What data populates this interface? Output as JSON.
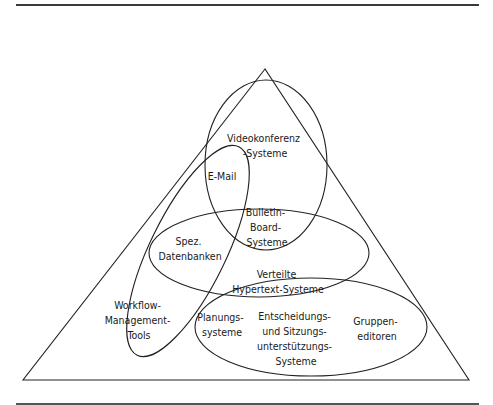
{
  "diagram": {
    "type": "venn-in-triangle",
    "frame": {
      "top_rule": true,
      "bottom_rule": true
    },
    "colors": {
      "stroke": "#222222",
      "text": "#1a1a1a",
      "background": "#ffffff"
    },
    "triangle": {
      "apex": [
        265,
        69
      ],
      "bottom_left": [
        23,
        380
      ],
      "bottom_right": [
        469,
        380
      ]
    },
    "regions": [
      {
        "id": "videokonferenz",
        "lines": [
          "Videokonferenz",
          "-Systeme"
        ]
      },
      {
        "id": "email",
        "lines": [
          "E-Mail"
        ]
      },
      {
        "id": "bulletin",
        "lines": [
          "Bulletin-",
          "Board-",
          "Systeme"
        ]
      },
      {
        "id": "datenbanken",
        "lines": [
          "Spez.",
          "Datenbanken"
        ]
      },
      {
        "id": "hypertext",
        "lines": [
          "Verteilte",
          "Hypertext-Systeme"
        ]
      },
      {
        "id": "workflow",
        "lines": [
          "Workflow-",
          "Management-",
          "Tools"
        ]
      },
      {
        "id": "planung",
        "lines": [
          "Planungs-",
          "systeme"
        ]
      },
      {
        "id": "entscheidung",
        "lines": [
          "Entscheidungs-",
          "und Sitzungs-",
          "unterstützungs-",
          "Systeme"
        ]
      },
      {
        "id": "gruppeneditoren",
        "lines": [
          "Gruppen-",
          "editoren"
        ]
      }
    ]
  }
}
